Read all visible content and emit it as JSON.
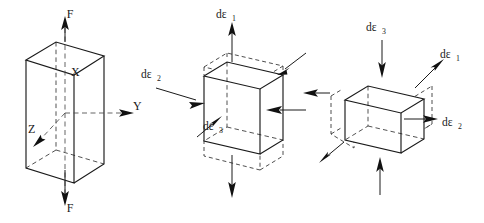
{
  "figure": {
    "background_color": "#ffffff",
    "line_color": "#1a1a1a",
    "width": 484,
    "height": 223,
    "panel_count": 3
  },
  "panels": [
    {
      "id": "panel-left",
      "name": "rectangular-prism-with-axes",
      "description": "Tall rectangular prism under uniaxial tensile force F along the X axis, with X, Y, Z coordinate axes",
      "shape": "rectangular-prism",
      "labels": {
        "force_top": "F",
        "force_bottom": "F",
        "axis_x": "X",
        "axis_y": "Y",
        "axis_z": "Z"
      },
      "arrows": [
        {
          "name": "force-arrow-top",
          "direction": "up",
          "label": "F"
        },
        {
          "name": "force-arrow-bottom",
          "direction": "down",
          "label": "F"
        },
        {
          "name": "axis-arrow-y",
          "direction": "right",
          "label": "Y"
        },
        {
          "name": "axis-arrow-z",
          "direction": "down-left",
          "label": "Z"
        }
      ]
    },
    {
      "id": "panel-middle",
      "name": "cube-elongating",
      "description": "Cube elongating along axis 1 (vertical tension) with lateral contraction along axes 2 and 3; dashed ghost outlines show the deformed shape",
      "shape": "cube",
      "labels": {
        "strain_1": "dε",
        "strain_1_sub": "1",
        "strain_2": "dε",
        "strain_2_sub": "2",
        "strain_3": "dε",
        "strain_3_sub": "3"
      },
      "arrows": [
        {
          "name": "strain-arrow-1-up",
          "direction": "up",
          "label": "dε₁",
          "sense": "tension"
        },
        {
          "name": "strain-arrow-1-down",
          "direction": "down",
          "label": "",
          "sense": "tension"
        },
        {
          "name": "strain-arrow-2-in",
          "direction": "right",
          "label": "dε₂",
          "sense": "compression"
        },
        {
          "name": "strain-arrow-2-in-right",
          "direction": "left",
          "label": "",
          "sense": "compression"
        },
        {
          "name": "strain-arrow-3-in",
          "direction": "up-right",
          "label": "dε₃",
          "sense": "compression"
        },
        {
          "name": "strain-arrow-3-in-back",
          "direction": "down-left",
          "label": "",
          "sense": "compression"
        }
      ]
    },
    {
      "id": "panel-right",
      "name": "cube-flattening",
      "description": "Cube compressed along axis 3 (vertical) and expanding along axes 1 and 2; dashed ghost outlines show the deformed shape",
      "shape": "cube",
      "labels": {
        "strain_3": "dε",
        "strain_3_sub": "3",
        "strain_1": "dε",
        "strain_1_sub": "1",
        "strain_2": "dε",
        "strain_2_sub": "2"
      },
      "arrows": [
        {
          "name": "strain-arrow-3-down",
          "direction": "down",
          "label": "dε₃",
          "sense": "compression"
        },
        {
          "name": "strain-arrow-3-up",
          "direction": "up",
          "label": "",
          "sense": "compression"
        },
        {
          "name": "strain-arrow-1-out",
          "direction": "up-right",
          "label": "dε₁",
          "sense": "tension"
        },
        {
          "name": "strain-arrow-1-out-back",
          "direction": "down-left",
          "label": "",
          "sense": "tension"
        },
        {
          "name": "strain-arrow-2-out",
          "direction": "right",
          "label": "dε₂",
          "sense": "tension"
        },
        {
          "name": "strain-arrow-2-out-left",
          "direction": "left",
          "label": "",
          "sense": "tension"
        }
      ]
    }
  ]
}
